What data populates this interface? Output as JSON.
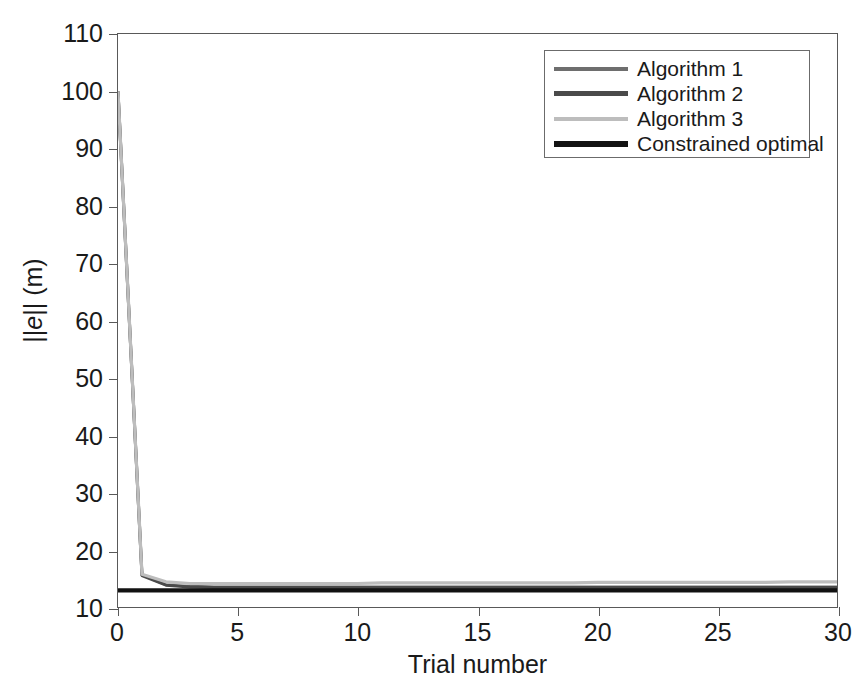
{
  "chart_data": {
    "type": "line",
    "title": "",
    "xlabel": "Trial number",
    "ylabel": "||e|| (m)",
    "xlim": [
      0,
      30
    ],
    "ylim": [
      10,
      110
    ],
    "xticks": [
      0,
      5,
      10,
      15,
      20,
      25,
      30
    ],
    "yticks": [
      10,
      20,
      30,
      40,
      50,
      60,
      70,
      80,
      90,
      100,
      110
    ],
    "grid": false,
    "legend_position": "upper right",
    "x": [
      0,
      1,
      2,
      3,
      4,
      5,
      6,
      7,
      8,
      9,
      10,
      11,
      12,
      13,
      14,
      15,
      16,
      17,
      18,
      19,
      20,
      21,
      22,
      23,
      24,
      25,
      26,
      27,
      28,
      29,
      30
    ],
    "series": [
      {
        "name": "Algorithm 1",
        "color": "#6e6e6e",
        "width": 3.0,
        "values": [
          100.0,
          15.6,
          13.9,
          13.6,
          13.5,
          13.5,
          13.5,
          13.5,
          13.5,
          13.5,
          13.5,
          13.5,
          13.5,
          13.5,
          13.5,
          13.5,
          13.5,
          13.5,
          13.5,
          13.5,
          13.5,
          13.5,
          13.5,
          13.5,
          13.5,
          13.5,
          13.5,
          13.5,
          13.5,
          13.5,
          13.5
        ]
      },
      {
        "name": "Algorithm 2",
        "color": "#4a4a4a",
        "width": 3.0,
        "values": [
          100.0,
          15.5,
          13.8,
          13.5,
          13.4,
          13.4,
          13.4,
          13.4,
          13.4,
          13.4,
          13.4,
          13.4,
          13.4,
          13.4,
          13.4,
          13.4,
          13.4,
          13.4,
          13.4,
          13.4,
          13.4,
          13.4,
          13.4,
          13.4,
          13.4,
          13.4,
          13.4,
          13.4,
          13.4,
          13.4,
          13.4
        ]
      },
      {
        "name": "Algorithm 3",
        "color": "#bdbdbd",
        "width": 3.2,
        "values": [
          100.0,
          15.7,
          14.4,
          14.1,
          14.1,
          14.1,
          14.1,
          14.1,
          14.1,
          14.1,
          14.1,
          14.2,
          14.2,
          14.2,
          14.2,
          14.2,
          14.2,
          14.2,
          14.2,
          14.2,
          14.3,
          14.3,
          14.3,
          14.3,
          14.3,
          14.3,
          14.3,
          14.3,
          14.4,
          14.4,
          14.4
        ]
      },
      {
        "name": "Constrained optimal",
        "color": "#121212",
        "width": 4.2,
        "values": [
          12.9,
          12.9,
          12.9,
          12.9,
          12.9,
          12.9,
          12.9,
          12.9,
          12.9,
          12.9,
          12.9,
          12.9,
          12.9,
          12.9,
          12.9,
          12.9,
          12.9,
          12.9,
          12.9,
          12.9,
          12.9,
          12.9,
          12.9,
          12.9,
          12.9,
          12.9,
          12.9,
          12.9,
          12.9,
          12.9,
          12.9
        ]
      }
    ]
  },
  "axes": {
    "x_title": "Trial number",
    "y_title_html": "||<i>e</i>|| (m)",
    "y_title_plain": "||e|| (m)",
    "x_tick_labels": [
      "0",
      "5",
      "10",
      "15",
      "20",
      "25",
      "30"
    ],
    "y_tick_labels": [
      "10",
      "20",
      "30",
      "40",
      "50",
      "60",
      "70",
      "80",
      "90",
      "100",
      "110"
    ]
  },
  "legend": {
    "entries": [
      {
        "label": "Algorithm 1",
        "color": "#6e6e6e",
        "thickness": 4
      },
      {
        "label": "Algorithm 2",
        "color": "#4a4a4a",
        "thickness": 5
      },
      {
        "label": "Algorithm 3",
        "color": "#bdbdbd",
        "thickness": 4
      },
      {
        "label": "Constrained optimal",
        "color": "#121212",
        "thickness": 6
      }
    ]
  },
  "colors": {
    "axis": "#595959",
    "text": "#1a1a1a",
    "background": "#ffffff",
    "legend_border": "#6b6b6b"
  }
}
